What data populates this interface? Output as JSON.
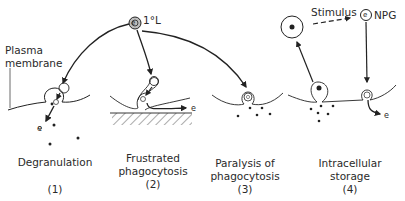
{
  "labels": {
    "primary_lysosome": "1°L",
    "plasma_membrane_line1": "Plasma",
    "plasma_membrane_line2": "membrane",
    "stimulus": "Stimulus",
    "npg": "NPG",
    "enzyme": "e"
  },
  "panels": [
    {
      "caption_line1": "Degranulation",
      "caption_line2": "",
      "number": "(1)"
    },
    {
      "caption_line1": "Frustrated",
      "caption_line2": "phagocytosis",
      "number": "(2)"
    },
    {
      "caption_line1": "Paralysis of",
      "caption_line2": "phagocytosis",
      "number": "(3)"
    },
    {
      "caption_line1": "Intracellular",
      "caption_line2": "storage",
      "number": "(4)"
    }
  ],
  "colors": {
    "stroke": "#222222",
    "lysosome_fill": "#bdbdbd",
    "hatch": "#555555"
  }
}
